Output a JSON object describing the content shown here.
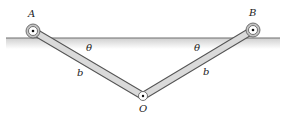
{
  "diagram": {
    "labels": {
      "A": "A",
      "B": "B",
      "O": "O",
      "theta_left": "θ",
      "theta_right": "θ",
      "b_left": "b",
      "b_right": "b"
    },
    "colors": {
      "ground_line": "#6e6e6e",
      "ground_shade": "#d6d6d6",
      "link_fill": "#d9d9d9",
      "link_stroke": "#555555",
      "pin_ring": "#bdbdbd"
    }
  }
}
